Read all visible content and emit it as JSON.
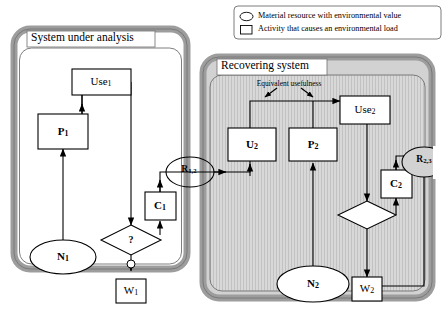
{
  "figure": {
    "background_color": "#ffffff",
    "line_color": "#000000",
    "panel_frame_color": "#9a9a9a",
    "panel_fill_color": "#ffffff",
    "recovering_fill_color": "#d5d5d5"
  },
  "legend": {
    "items": [
      {
        "symbol": "ellipse-icon",
        "label": "Material resource with environmental value"
      },
      {
        "symbol": "rectangle-icon",
        "label": "Activity that causes an environmental load"
      }
    ]
  },
  "panels": [
    {
      "id": "system-under-analysis",
      "title": "System under analysis"
    },
    {
      "id": "recovering-system",
      "title": "Recovering system"
    }
  ],
  "annotations": [
    {
      "id": "equivalent-usefulness",
      "text": "Equivalent usefulness"
    }
  ],
  "nodes": [
    {
      "id": "use-1",
      "type": "activity",
      "label": "Use",
      "sub": "1"
    },
    {
      "id": "p-1",
      "type": "activity",
      "label": "P",
      "sub": "1"
    },
    {
      "id": "c-1",
      "type": "activity",
      "label": "C",
      "sub": "1"
    },
    {
      "id": "w-1",
      "type": "activity",
      "label": "W",
      "sub": "1"
    },
    {
      "id": "n-1",
      "type": "resource",
      "label": "N",
      "sub": "1"
    },
    {
      "id": "decision-1",
      "type": "decision",
      "label": "?",
      "sub": ""
    },
    {
      "id": "r-1-2",
      "type": "connector",
      "label": "R",
      "sub": "1,2"
    },
    {
      "id": "use-2",
      "type": "activity",
      "label": "Use",
      "sub": "2"
    },
    {
      "id": "u-2",
      "type": "activity",
      "label": "U",
      "sub": "2"
    },
    {
      "id": "p-2",
      "type": "activity",
      "label": "P",
      "sub": "2"
    },
    {
      "id": "c-2",
      "type": "activity",
      "label": "C",
      "sub": "2"
    },
    {
      "id": "w-2",
      "type": "activity",
      "label": "W",
      "sub": "2"
    },
    {
      "id": "n-2",
      "type": "resource",
      "label": "N",
      "sub": "2"
    },
    {
      "id": "decision-2",
      "type": "decision",
      "label": "",
      "sub": ""
    },
    {
      "id": "r-2-3",
      "type": "connector",
      "label": "R",
      "sub": "2,3"
    }
  ]
}
